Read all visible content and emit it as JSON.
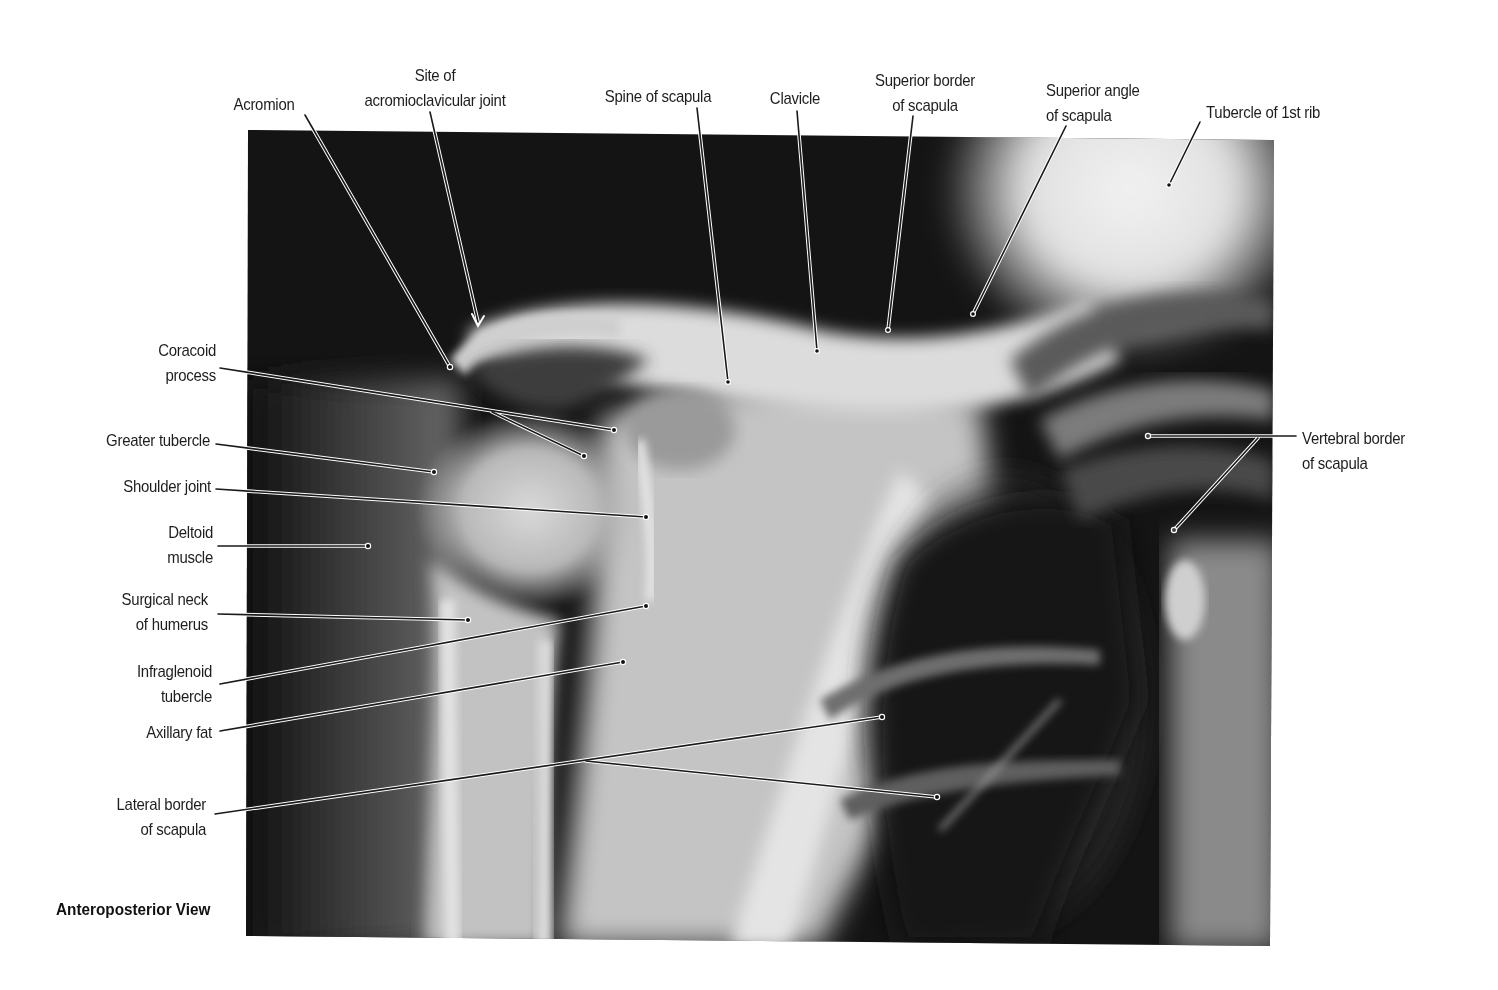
{
  "figure": {
    "view_title": "Anteroposterior View",
    "image": {
      "type": "radiograph",
      "subject": "shoulder"
    }
  },
  "labels": {
    "acromion": {
      "lines": [
        "Acromion"
      ]
    },
    "ac_joint": {
      "lines": [
        "Site of",
        "acromioclavicular joint"
      ]
    },
    "spine_scapula": {
      "lines": [
        "Spine of scapula"
      ]
    },
    "clavicle": {
      "lines": [
        "Clavicle"
      ]
    },
    "superior_border": {
      "lines": [
        "Superior border",
        "of scapula"
      ]
    },
    "superior_angle": {
      "lines": [
        "Superior angle",
        "of scapula"
      ]
    },
    "tubercle_1st_rib": {
      "lines": [
        "Tubercle of 1st rib"
      ]
    },
    "coracoid": {
      "lines": [
        "Coracoid",
        "process"
      ]
    },
    "greater_tubercle": {
      "lines": [
        "Greater tubercle"
      ]
    },
    "shoulder_joint": {
      "lines": [
        "Shoulder joint"
      ]
    },
    "deltoid": {
      "lines": [
        "Deltoid",
        "muscle"
      ]
    },
    "surgical_neck": {
      "lines": [
        "Surgical neck",
        "of humerus"
      ]
    },
    "infraglenoid": {
      "lines": [
        "Infraglenoid",
        "tubercle"
      ]
    },
    "axillary_fat": {
      "lines": [
        "Axillary fat"
      ]
    },
    "lateral_border": {
      "lines": [
        "Lateral border",
        "of scapula"
      ]
    },
    "vertebral_border": {
      "lines": [
        "Vertebral border",
        "of scapula"
      ]
    }
  }
}
